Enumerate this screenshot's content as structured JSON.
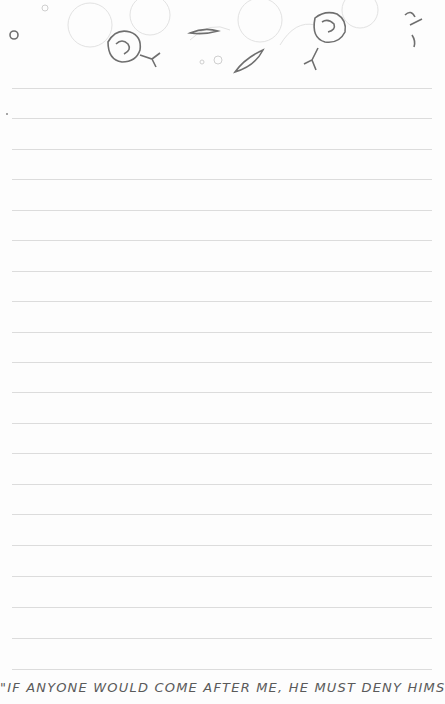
{
  "page": {
    "type": "lined notepad page",
    "line_count": 20,
    "first_line_y": 88,
    "line_spacing": 30.5,
    "line_color": "#dcdcdc"
  },
  "header": {
    "decoration": "floral border illustration",
    "accent_color": "#6f6f6f"
  },
  "footer": {
    "quote": "\"IF ANYONE WOULD COME AFTER ME, HE MUST DENY HIMSELF"
  }
}
